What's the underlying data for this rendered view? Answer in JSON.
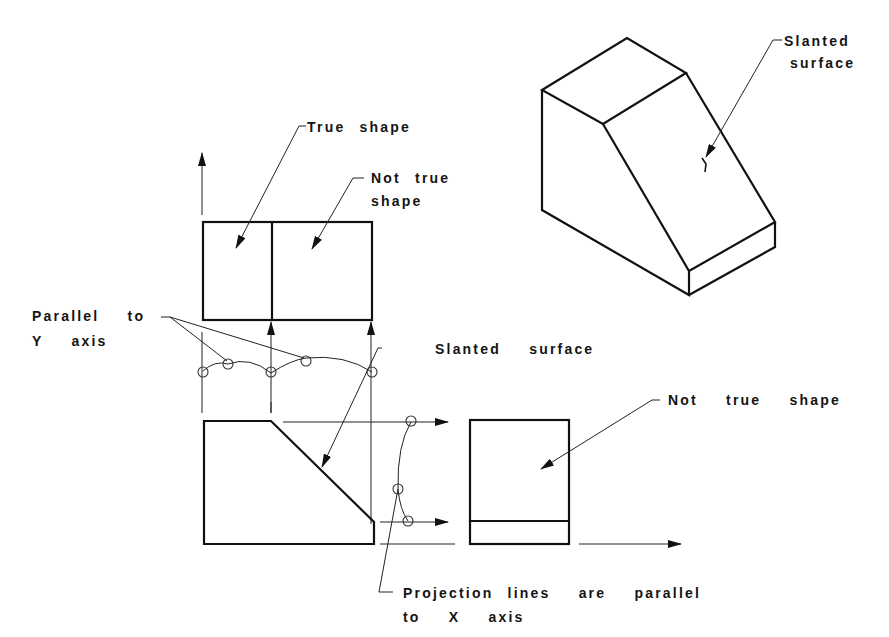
{
  "figure": {
    "colors": {
      "line": "#111111",
      "background": "#ffffff"
    }
  },
  "labels": {
    "slanted_surface_iso_line1": "Slanted",
    "slanted_surface_iso_line2": "surface",
    "true_shape": "True shape",
    "not_true_shape_top_line1": "Not true",
    "not_true_shape_top_line2": "shape",
    "parallel_to_y_line1": "Parallel  to",
    "parallel_to_y_line2": "Y  axis",
    "slanted_surface_front": "Slanted  surface",
    "not_true_shape_side": "Not  true  shape",
    "projection_lines_line1": "Projection lines  are  parallel",
    "projection_lines_line2": "to  X  axis"
  },
  "views": [
    {
      "name": "isometric",
      "description": "3D block with slanted face"
    },
    {
      "name": "top-view",
      "description": "rectangle divided into two regions"
    },
    {
      "name": "front-view",
      "description": "pentagon with 45-degree slanted edge"
    },
    {
      "name": "side-view",
      "description": "rectangle with horizontal base strip"
    }
  ]
}
